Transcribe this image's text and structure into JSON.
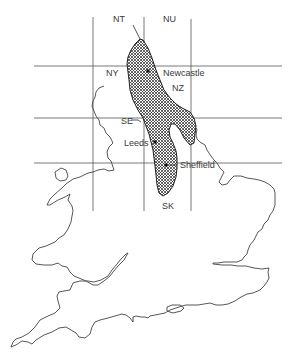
{
  "map": {
    "title": "",
    "grid_squares": [
      {
        "label": "NT",
        "x": 119,
        "y": 22
      },
      {
        "label": "NU",
        "x": 167,
        "y": 22
      },
      {
        "label": "NY",
        "x": 110,
        "y": 76
      },
      {
        "label": "NZ",
        "x": 172,
        "y": 91
      },
      {
        "label": "SE",
        "x": 122,
        "y": 124
      },
      {
        "label": "SK",
        "x": 168,
        "y": 209
      }
    ],
    "cities": [
      {
        "name": "Newcastle",
        "x": 148,
        "y": 71,
        "label_x": 163,
        "label_y": 76
      },
      {
        "name": "Leeds",
        "x": 155,
        "y": 142,
        "label_x": 124,
        "label_y": 146
      },
      {
        "name": "Sheffield",
        "x": 166,
        "y": 165,
        "label_x": 180,
        "label_y": 168
      }
    ],
    "grid": {
      "horizontal_y": [
        66,
        118,
        163
      ],
      "vertical_x": [
        93,
        144,
        191
      ],
      "x_extent": [
        34,
        282
      ],
      "y_extent": [
        16,
        212
      ]
    },
    "shaded_region": "Coalfield / outcrop area (crosshatched)",
    "colors": {
      "line": "#444444",
      "hatch": "#222222",
      "background": "#ffffff"
    }
  }
}
